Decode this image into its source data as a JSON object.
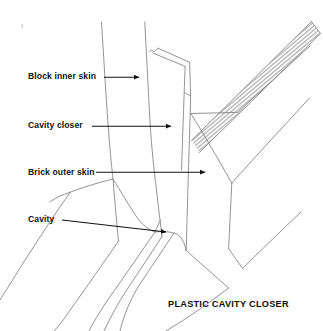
{
  "figure": {
    "title": "PLASTIC CAVITY CLOSER",
    "type": "technical-line-drawing",
    "background_color": "#ffffff",
    "ink_color": "#8a8a8a",
    "text_color": "#111111",
    "arrow_color": "#111111"
  },
  "callouts": [
    {
      "id": "block-inner-skin",
      "label": "Block inner skin",
      "label_x": 28,
      "label_y": 72,
      "arrow_from_x": 104,
      "arrow_from_y": 77,
      "arrow_to_x": 140,
      "arrow_to_y": 77
    },
    {
      "id": "cavity-closer",
      "label": "Cavity closer",
      "label_x": 28,
      "label_y": 121,
      "arrow_from_x": 92,
      "arrow_from_y": 126,
      "arrow_to_x": 172,
      "arrow_to_y": 126
    },
    {
      "id": "brick-outer-skin",
      "label": "Brick outer skin",
      "label_x": 28,
      "label_y": 168,
      "arrow_from_x": 96,
      "arrow_from_y": 172,
      "arrow_to_x": 206,
      "arrow_to_y": 172
    },
    {
      "id": "cavity",
      "label": "Cavity",
      "label_x": 28,
      "label_y": 215,
      "arrow_from_x": 62,
      "arrow_from_y": 220,
      "arrow_to_x": 167,
      "arrow_to_y": 232
    }
  ],
  "caption": {
    "text": "PLASTIC CAVITY CLOSER",
    "x": 168,
    "y": 300
  },
  "geometry": {
    "inner_skin_lines": [
      "M 102,22 L 108,128 L 112,178 L 118,240",
      "M 145,22 L 150,120 L 156,178 L 162,236"
    ],
    "closer_block": "M 150,50 L 152,52 L 158,48 L 190,62 L 191,96 L 186,250 L 150,120",
    "closer_top_face": "M 152,52 L 158,48 L 190,62 L 186,92 L 152,74 Z",
    "hatch_band": "M 190,140 L 236,96 L 312,22 L 320,34 L 198,152 Z",
    "hatch_stroke_count": 26,
    "brick_outer_block": "M 191,96 L 232,183 L 294,116 L 252,40",
    "lower_return": "M 232,183 L 228,248 L 243,268 L 300,214",
    "wall_courses": [
      "M 112,178 L 64,196 L 10,296",
      "M 118,240 L 60,330",
      "M 150,232 L 96,330",
      "M 167,236 L 124,331",
      "M 186,250 L 232,292 L 160,331"
    ],
    "speck": {
      "x": 22,
      "y": 25,
      "w": 2,
      "h": 4
    }
  }
}
